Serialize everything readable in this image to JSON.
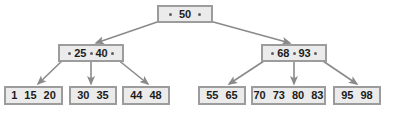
{
  "diagram": {
    "type": "b-tree",
    "colors": {
      "node_fill": "#ebebeb",
      "node_border": "#9c9c9c",
      "text": "#1c1c1c",
      "edge": "#8a8a8a",
      "pointer_dot": "#5e5e5e",
      "background": "#ffffff"
    },
    "levels": 3,
    "nodes": [
      {
        "id": "root",
        "level": 0,
        "role": "root",
        "keys": [
          "50"
        ],
        "pointer_count": 2,
        "x": 157,
        "y": 5,
        "w": 56,
        "h": 18
      },
      {
        "id": "internal-left",
        "level": 1,
        "role": "internal",
        "keys": [
          "25",
          "40"
        ],
        "pointer_count": 3,
        "x": 58,
        "y": 44,
        "w": 66,
        "h": 18
      },
      {
        "id": "internal-right",
        "level": 1,
        "role": "internal",
        "keys": [
          "68",
          "93"
        ],
        "pointer_count": 3,
        "x": 261,
        "y": 44,
        "w": 66,
        "h": 18
      },
      {
        "id": "leaf-1",
        "level": 2,
        "role": "leaf",
        "keys": [
          "1",
          "15",
          "20"
        ],
        "pointer_count": 0,
        "x": 4,
        "y": 86,
        "w": 59,
        "h": 19
      },
      {
        "id": "leaf-2",
        "level": 2,
        "role": "leaf",
        "keys": [
          "30",
          "35"
        ],
        "pointer_count": 0,
        "x": 69,
        "y": 86,
        "w": 48,
        "h": 19
      },
      {
        "id": "leaf-3",
        "level": 2,
        "role": "leaf",
        "keys": [
          "44",
          "48"
        ],
        "pointer_count": 0,
        "x": 122,
        "y": 86,
        "w": 48,
        "h": 19
      },
      {
        "id": "leaf-4",
        "level": 2,
        "role": "leaf",
        "keys": [
          "55",
          "65"
        ],
        "pointer_count": 0,
        "x": 198,
        "y": 86,
        "w": 48,
        "h": 19
      },
      {
        "id": "leaf-5",
        "level": 2,
        "role": "leaf",
        "keys": [
          "70",
          "73",
          "80",
          "83"
        ],
        "pointer_count": 0,
        "x": 251,
        "y": 86,
        "w": 75,
        "h": 19
      },
      {
        "id": "leaf-6",
        "level": 2,
        "role": "leaf",
        "keys": [
          "95",
          "98"
        ],
        "pointer_count": 0,
        "x": 333,
        "y": 86,
        "w": 48,
        "h": 19
      }
    ],
    "edges": [
      {
        "id": "edge-root-left",
        "from": "root",
        "to": "internal-left",
        "x1": 163,
        "y1": 20,
        "x2": 96,
        "y2": 43
      },
      {
        "id": "edge-root-right",
        "from": "root",
        "to": "internal-right",
        "x1": 206,
        "y1": 20,
        "x2": 290,
        "y2": 43
      },
      {
        "id": "edge-left-leaf1",
        "from": "internal-left",
        "to": "leaf-1",
        "x1": 64,
        "y1": 59,
        "x2": 38,
        "y2": 84
      },
      {
        "id": "edge-left-leaf2",
        "from": "internal-left",
        "to": "leaf-2",
        "x1": 91,
        "y1": 59,
        "x2": 91,
        "y2": 84
      },
      {
        "id": "edge-left-leaf3",
        "from": "internal-left",
        "to": "leaf-3",
        "x1": 117,
        "y1": 59,
        "x2": 148,
        "y2": 84
      },
      {
        "id": "edge-right-leaf4",
        "from": "internal-right",
        "to": "leaf-4",
        "x1": 267,
        "y1": 59,
        "x2": 229,
        "y2": 84
      },
      {
        "id": "edge-right-leaf5",
        "from": "internal-right",
        "to": "leaf-5",
        "x1": 294,
        "y1": 59,
        "x2": 294,
        "y2": 84
      },
      {
        "id": "edge-right-leaf6",
        "from": "internal-right",
        "to": "leaf-6",
        "x1": 320,
        "y1": 59,
        "x2": 357,
        "y2": 84
      }
    ]
  }
}
